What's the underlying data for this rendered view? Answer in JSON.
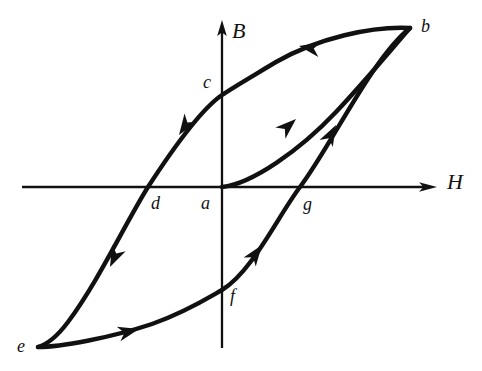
{
  "figure": {
    "type": "hysteresis-curve-diagram",
    "background_color": "#ffffff",
    "ink_color": "#111111"
  },
  "axes": {
    "vertical": {
      "label": "B",
      "name": "magnetic-flux-density-axis",
      "direction": "up",
      "x": 222,
      "top_y": 22,
      "bottom_y": 348,
      "label_x": 232,
      "label_y": 22
    },
    "horizontal": {
      "label": "H",
      "name": "magnetic-field-strength-axis",
      "direction": "right",
      "y": 187,
      "left_x": 22,
      "right_x": 437,
      "label_x": 448,
      "label_y": 172
    }
  },
  "points": [
    {
      "id": "a",
      "label": "a",
      "x": 222,
      "y": 187,
      "label_x": 202,
      "label_y": 195,
      "meaning": "origin-unmagnetized-state"
    },
    {
      "id": "b",
      "label": "b",
      "x": 410,
      "y": 28,
      "label_x": 421,
      "label_y": 16,
      "meaning": "positive-saturation"
    },
    {
      "id": "c",
      "label": "c",
      "x": 222,
      "y": 95,
      "label_x": 203,
      "label_y": 74,
      "meaning": "positive-remanence"
    },
    {
      "id": "d",
      "label": "d",
      "x": 148,
      "y": 187,
      "label_x": 151,
      "label_y": 195,
      "meaning": "negative-coercivity"
    },
    {
      "id": "e",
      "label": "e",
      "x": 38,
      "y": 347,
      "label_x": 18,
      "label_y": 337,
      "meaning": "negative-saturation"
    },
    {
      "id": "f",
      "label": "f",
      "x": 222,
      "y": 290,
      "label_x": 230,
      "label_y": 288,
      "meaning": "negative-remanence"
    },
    {
      "id": "g",
      "label": "g",
      "x": 300,
      "y": 187,
      "label_x": 303,
      "label_y": 196,
      "meaning": "positive-coercivity"
    }
  ],
  "curves": [
    {
      "name": "initial-magnetization-curve",
      "from": "a",
      "to": "b",
      "path": "M 222 187 C 252 184, 300 150, 336 112 C 368 78, 394 46, 410 28",
      "arrow": {
        "x": 294,
        "y": 122,
        "angle": -42
      }
    },
    {
      "name": "descending-branch-b-to-e",
      "from": "b",
      "to": "e",
      "path": "M 410 28 C 372 26, 318 38, 276 62 C 246 80, 232 88, 222 95 C 200 110, 172 150, 148 187 C 126 222, 98 282, 68 322 C 56 338, 45 345, 38 347",
      "arrows": [
        {
          "x": 312,
          "y": 44,
          "angle": 193
        },
        {
          "x": 181,
          "y": 131,
          "angle": 123
        },
        {
          "x": 112,
          "y": 264,
          "angle": 113
        }
      ]
    },
    {
      "name": "ascending-branch-e-to-b",
      "from": "e",
      "to": "b",
      "path": "M 38 347 C 60 347, 110 338, 152 324 C 186 312, 208 298, 222 290 C 252 272, 278 216, 300 187 C 330 148, 372 58, 410 28",
      "arrows": [
        {
          "x": 134,
          "y": 330,
          "angle": -15
        },
        {
          "x": 259,
          "y": 249,
          "angle": -54
        },
        {
          "x": 332,
          "y": 131,
          "angle": -63
        }
      ]
    }
  ],
  "annotations": {
    "loop_direction": "counter-clockwise",
    "arrow_count": 6
  }
}
